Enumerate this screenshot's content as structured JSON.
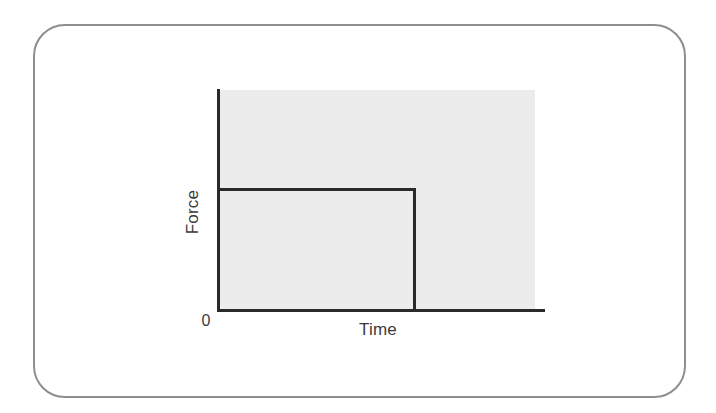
{
  "figure": {
    "frame_border_color": "#8e8e8e",
    "page_background": "#ffffff"
  },
  "chart_data": {
    "type": "line",
    "title": "",
    "subtitle": "",
    "xlabel": "Time",
    "ylabel": "Force",
    "origin_label": "0",
    "grid": false,
    "legend": null,
    "plot_background_color": "#ececec",
    "line_color": "#2a2a2a",
    "axis_color": "#2a2a2a",
    "xlim": [
      0,
      1
    ],
    "ylim": [
      0,
      1
    ],
    "x_tick_labels": [
      "0"
    ],
    "y_tick_labels": [],
    "annotations": [],
    "series": [
      {
        "name": "Force",
        "x": [
          0.0,
          0.62,
          0.62
        ],
        "y": [
          0.55,
          0.55,
          0.0
        ]
      }
    ],
    "step": {
      "plateau_force_level": 0.55,
      "pulse_end_time": 0.62,
      "force_after_pulse": 0.0
    }
  }
}
